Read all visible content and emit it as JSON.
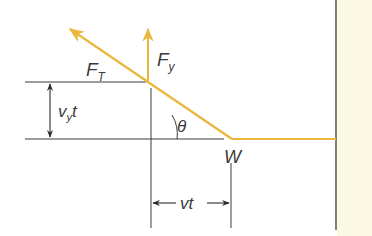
{
  "diagram": {
    "type": "force diagram",
    "colors": {
      "rope": "#e8b73c",
      "line": "#3a3a3a",
      "wall_fill": "#fbf8e4"
    },
    "labels": {
      "tension_main": "F",
      "tension_sub": "T",
      "vertical_main": "F",
      "vertical_sub": "y",
      "vertical_distance_main": "v",
      "vertical_distance_sub": "y",
      "vertical_distance_suffix": "t",
      "angle": "θ",
      "weight_point": "W",
      "horizontal_distance": "vt"
    },
    "elements": [
      {
        "name": "tension-vector",
        "label": "F_T",
        "from": [
          232,
          139
        ],
        "to": [
          68,
          28
        ]
      },
      {
        "name": "vertical-component",
        "label": "F_y",
        "from": [
          148,
          82
        ],
        "to": [
          148,
          28
        ]
      },
      {
        "name": "rope-horizontal",
        "from": [
          232,
          139
        ],
        "to": [
          336,
          139
        ]
      },
      {
        "name": "wall",
        "x": 336
      }
    ]
  }
}
